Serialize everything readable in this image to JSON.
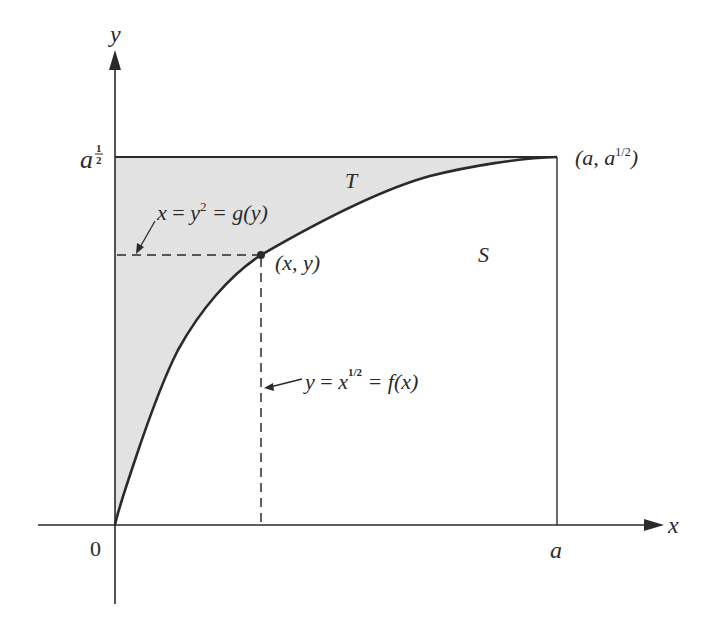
{
  "figure": {
    "axes": {
      "x_label": "x",
      "y_label": "y",
      "origin_label": "0",
      "x_tick_label": "a",
      "y_tick_label_base": "a",
      "y_tick_label_exp_num": "1",
      "y_tick_label_exp_den": "2"
    },
    "regions": {
      "T_label": "T",
      "S_label": "S",
      "shade_color": "#e4e4e4"
    },
    "point_labels": {
      "corner_open": "(a, a",
      "corner_exp": "1/2",
      "corner_close": ")",
      "point": "(x, y)"
    },
    "annotations": {
      "g_eq_x": "x",
      "g_eq_mid": "=",
      "g_eq_y": "y",
      "g_eq_sq": "2",
      "g_eq_rest": "= g(y)",
      "f_eq_y": "y",
      "f_eq_mid": "=",
      "f_eq_x": "x",
      "f_eq_exp": "1/2",
      "f_eq_rest": "= f(x)"
    },
    "colors": {
      "ink": "#2a2a2a",
      "shade": "#e4e4e4"
    }
  }
}
